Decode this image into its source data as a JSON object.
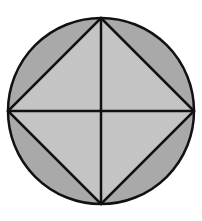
{
  "diagram": {
    "circle": {
      "cx": 101,
      "cy": 111,
      "r": 93,
      "fill": "#a9a9a9",
      "stroke": "#111111"
    },
    "square": {
      "points": "101,18 194,111 101,204 8,111",
      "fill": "#c4c4c4",
      "stroke": "#111111"
    },
    "diagonals": [
      {
        "x1": 101,
        "y1": 18,
        "x2": 101,
        "y2": 204
      },
      {
        "x1": 8,
        "y1": 111,
        "x2": 194,
        "y2": 111
      }
    ],
    "colors": {
      "segment_fill": "#a9a9a9",
      "square_fill": "#c4c4c4",
      "line": "#111111"
    }
  }
}
